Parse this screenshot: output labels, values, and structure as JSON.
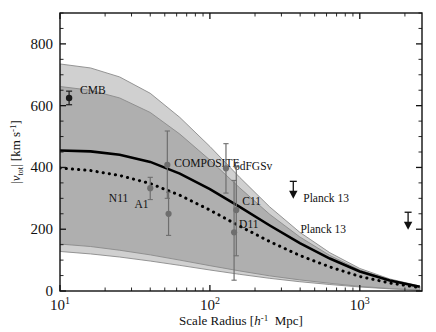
{
  "chart_data": {
    "type": "line",
    "title": "",
    "xlabel": "Scale Radius [h^-1  Mpc]",
    "ylabel": "|v_tot| [km s^-1]",
    "xscale": "log",
    "yscale": "linear",
    "xlim": [
      10,
      2600
    ],
    "ylim": [
      0,
      900
    ],
    "grid": false,
    "legend": "none",
    "xtick_labels": [
      "10",
      "10",
      "10"
    ],
    "xtick_exponents": [
      "1",
      "2",
      "3"
    ],
    "xtick_values": [
      10,
      100,
      1000
    ],
    "ytick_labels": [
      "0",
      "200",
      "400",
      "600",
      "800"
    ],
    "ytick_values": [
      0,
      200,
      400,
      600,
      800
    ],
    "series": [
      {
        "name": "LCDM mean (solid)",
        "style": "solid-black",
        "x": [
          10,
          16,
          25,
          40,
          63,
          100,
          158,
          251,
          398,
          631,
          1000,
          1585,
          2512
        ],
        "values": [
          455,
          452,
          441,
          418,
          380,
          330,
          272,
          212,
          155,
          105,
          63,
          34,
          14
        ]
      },
      {
        "name": "alternative model (dotted)",
        "style": "dotted-black",
        "x": [
          10,
          16,
          25,
          40,
          63,
          100,
          158,
          251,
          398,
          631,
          1000,
          1585,
          2512
        ],
        "values": [
          398,
          390,
          374,
          348,
          310,
          262,
          210,
          160,
          115,
          78,
          47,
          26,
          11
        ]
      }
    ],
    "bands": [
      {
        "name": "outer 95% band",
        "shade": "#c8c8c8",
        "x": [
          10,
          16,
          25,
          40,
          63,
          100,
          158,
          251,
          398,
          631,
          1000,
          1585,
          2512
        ],
        "upper": [
          735,
          722,
          693,
          640,
          562,
          468,
          368,
          272,
          190,
          124,
          73,
          39,
          16
        ],
        "lower": [
          128,
          120,
          110,
          97,
          83,
          68,
          54,
          41,
          30,
          21,
          13,
          7,
          3
        ]
      },
      {
        "name": "inner 68% band",
        "shade": "#a6a6a6",
        "x": [
          10,
          16,
          25,
          40,
          63,
          100,
          158,
          251,
          398,
          631,
          1000,
          1585,
          2512
        ],
        "upper": [
          662,
          650,
          625,
          578,
          508,
          424,
          334,
          248,
          175,
          115,
          68,
          36,
          15
        ],
        "lower": [
          152,
          144,
          132,
          117,
          100,
          82,
          65,
          49,
          36,
          25,
          15,
          8,
          3
        ]
      }
    ],
    "points": [
      {
        "label": "CMB",
        "x": 11.5,
        "y": 625,
        "yerr_up": 22,
        "yerr_dn": 22,
        "marker": "dark-circle",
        "label_dx": 11,
        "label_dy": -4
      },
      {
        "label": "N11",
        "x": 40,
        "y": 333,
        "yerr_up": 35,
        "yerr_dn": 37,
        "marker": "gray-circle",
        "label_dx": -22,
        "label_dy": 14
      },
      {
        "label": "A1",
        "x": 53,
        "y": 250,
        "yerr_up": 70,
        "yerr_dn": 70,
        "marker": "gray-circle",
        "label_dx": -20,
        "label_dy": -6
      },
      {
        "label": "COMPOSITE",
        "x": 52,
        "y": 408,
        "yerr_up": 110,
        "yerr_dn": 108,
        "marker": "gray-circle",
        "label_dx": 7,
        "label_dy": 2
      },
      {
        "label": "6dFGSv",
        "x": 128,
        "y": 397,
        "yerr_up": 80,
        "yerr_dn": 80,
        "marker": "gray-circle",
        "label_dx": 8,
        "label_dy": 2
      },
      {
        "label": "C11",
        "x": 150,
        "y": 262,
        "yerr_up": 140,
        "yerr_dn": 148,
        "marker": "gray-circle",
        "label_dx": 6,
        "label_dy": -5
      },
      {
        "label": "D11",
        "x": 145,
        "y": 190,
        "yerr_up": 168,
        "yerr_dn": 155,
        "marker": "gray-circle",
        "label_dx": 5,
        "label_dy": -4
      }
    ],
    "upper_limits": [
      {
        "label": "Planck 13",
        "x": 360,
        "y": 355,
        "cap_to": 308,
        "label_dx": 10,
        "label_dy": 6
      },
      {
        "label": "Planck 13",
        "x": 2100,
        "y": 255,
        "cap_to": 208,
        "label_dx": -62,
        "label_dy": 6
      }
    ]
  }
}
